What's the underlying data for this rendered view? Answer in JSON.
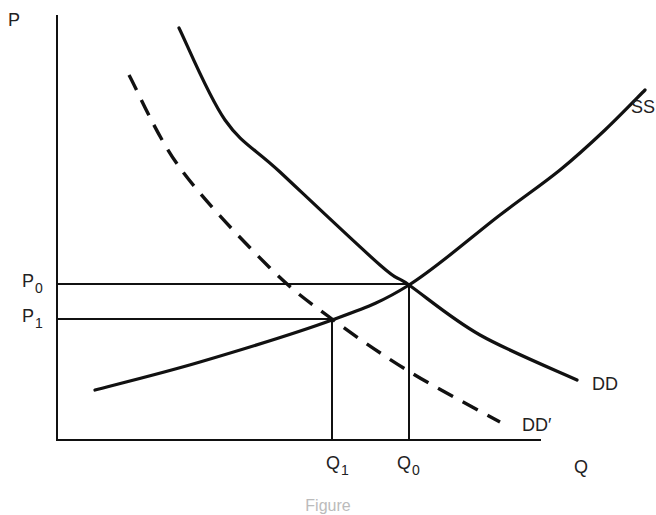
{
  "chart_data": {
    "type": "line",
    "title": "",
    "xlabel": "Q",
    "ylabel": "P",
    "grid": false,
    "legend": "inline labels at curve ends",
    "axis_ticks": {
      "x": [
        {
          "label": "Q",
          "sub": "1"
        },
        {
          "label": "Q",
          "sub": "0"
        }
      ],
      "y": [
        {
          "label": "P",
          "sub": "0"
        },
        {
          "label": "P",
          "sub": "1"
        }
      ]
    },
    "series": [
      {
        "name": "SS",
        "style": "solid",
        "description": "upward-sloping supply curve",
        "points": [
          [
            95,
            390
          ],
          [
            200,
            362
          ],
          [
            332,
            320
          ],
          [
            409,
            285
          ],
          [
            500,
            215
          ],
          [
            560,
            170
          ],
          [
            605,
            130
          ],
          [
            645,
            90
          ]
        ]
      },
      {
        "name": "DD",
        "style": "solid",
        "description": "original downward-sloping demand curve",
        "points": [
          [
            179,
            28
          ],
          [
            225,
            120
          ],
          [
            280,
            172
          ],
          [
            380,
            265
          ],
          [
            409,
            285
          ],
          [
            480,
            335
          ],
          [
            577,
            380
          ]
        ]
      },
      {
        "name": "DD′",
        "style": "dashed",
        "description": "shifted (lower) demand curve",
        "points": [
          [
            129,
            75
          ],
          [
            180,
            168
          ],
          [
            270,
            268
          ],
          [
            332,
            319
          ],
          [
            410,
            372
          ],
          [
            500,
            422
          ]
        ]
      }
    ],
    "equilibria": [
      {
        "name": "original",
        "price": "P0",
        "quantity": "Q0",
        "pixel": [
          409,
          285
        ]
      },
      {
        "name": "new",
        "price": "P1",
        "quantity": "Q1",
        "pixel": [
          332,
          319
        ]
      }
    ]
  },
  "labels": {
    "y_axis": "P",
    "x_axis": "Q",
    "p0": {
      "main": "P",
      "sub": "0"
    },
    "p1": {
      "main": "P",
      "sub": "1"
    },
    "q0": {
      "main": "Q",
      "sub": "0"
    },
    "q1": {
      "main": "Q",
      "sub": "1"
    },
    "ss": "SS",
    "dd": "DD",
    "dd_prime": "DD′"
  },
  "caption": "Figure"
}
